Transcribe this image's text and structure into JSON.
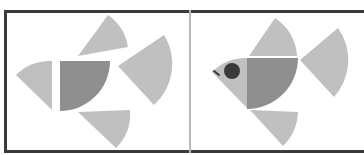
{
  "figure": {
    "panels": [
      {
        "id": "left",
        "description": "Exploded quarter-circle pieces"
      },
      {
        "id": "right",
        "description": "Assembled fish shape"
      }
    ],
    "colors": {
      "light_piece": "#c0c0c0",
      "dark_piece": "#8f8f8f",
      "eye": "#3a3a3a",
      "frame": "#3a3a3a",
      "divider": "#b8b8b8"
    }
  }
}
